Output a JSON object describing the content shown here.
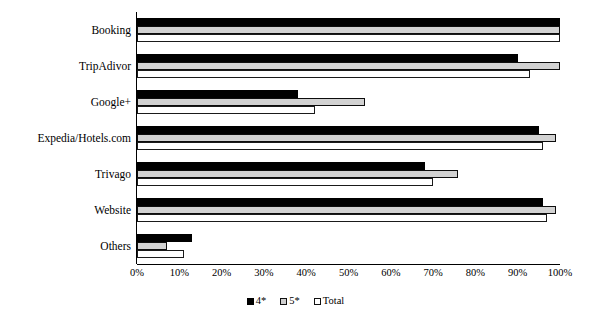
{
  "chart_data": {
    "type": "bar",
    "orientation": "horizontal",
    "title": "",
    "xlabel": "",
    "ylabel": "",
    "xlim": [
      0,
      100
    ],
    "xtick_labels": [
      "0%",
      "10%",
      "20%",
      "30%",
      "40%",
      "50%",
      "60%",
      "70%",
      "80%",
      "90%",
      "100%"
    ],
    "xtick_values": [
      0,
      10,
      20,
      30,
      40,
      50,
      60,
      70,
      80,
      90,
      100
    ],
    "grid": false,
    "legend_position": "bottom",
    "categories": [
      "Booking",
      "TripAdivor",
      "Google+",
      "Expedia/Hotels.com",
      "Trivago",
      "Website",
      "Others"
    ],
    "series": [
      {
        "name": "4*",
        "color": "#000000",
        "values": [
          100,
          90,
          38,
          95,
          68,
          96,
          13
        ]
      },
      {
        "name": "5*",
        "color": "#d2d2d2",
        "values": [
          100,
          100,
          54,
          99,
          76,
          99,
          7
        ]
      },
      {
        "name": "Total",
        "color": "#ffffff",
        "values": [
          100,
          93,
          42,
          96,
          70,
          97,
          11
        ]
      }
    ]
  },
  "legend": {
    "items": [
      {
        "label": "4*",
        "swatch": "black-square-icon"
      },
      {
        "label": "5*",
        "swatch": "gray-square-icon"
      },
      {
        "label": "Total",
        "swatch": "white-square-icon"
      }
    ]
  }
}
